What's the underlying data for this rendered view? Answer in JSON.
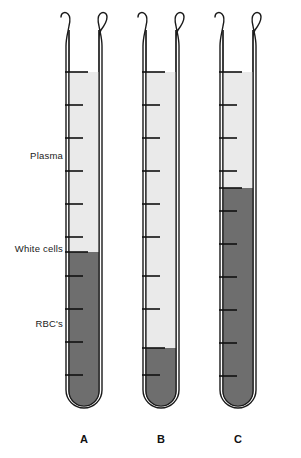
{
  "figure": {
    "background_color": "#ffffff",
    "width": 301,
    "height": 458
  },
  "colors": {
    "plasma_fill": "#eaeaea",
    "rbc_fill": "#6e6e6e",
    "glass_outline": "#1a1a1a",
    "graduation_mark": "#111111",
    "text": "#1a1a1a"
  },
  "side_labels": [
    {
      "id": "plasma",
      "text": "Plasma",
      "y": 150
    },
    {
      "id": "white-cells",
      "text": "White cells",
      "y": 243
    },
    {
      "id": "rbcs",
      "text": "RBC's",
      "y": 318
    }
  ],
  "tubes": [
    {
      "id": "A",
      "caption": "A",
      "center_x": 84,
      "plasma_top_y": 72,
      "rbc_top_y": 252,
      "fill_bottom_y": 405,
      "graduation_count": 10
    },
    {
      "id": "B",
      "caption": "B",
      "center_x": 161,
      "plasma_top_y": 72,
      "rbc_top_y": 348,
      "fill_bottom_y": 405,
      "graduation_count": 10
    },
    {
      "id": "C",
      "caption": "C",
      "center_x": 238,
      "plasma_top_y": 72,
      "rbc_top_y": 188,
      "fill_bottom_y": 405,
      "graduation_count": 10
    }
  ],
  "chart_data": {
    "type": "bar",
    "xlabel": "",
    "ylabel": "Tube level",
    "categories": [
      "A",
      "B",
      "C"
    ],
    "grid": false,
    "legend_position": "left",
    "series": [
      {
        "name": "Plasma",
        "values": [
          54,
          83,
          19
        ]
      },
      {
        "name": "White cells",
        "values": [
          1,
          1,
          1
        ]
      },
      {
        "name": "RBC's",
        "values": [
          45,
          16,
          80
        ]
      }
    ],
    "annotations": [
      "Tube A shows a normal hematocrit with plasma above the buffy coat and packed red cells below.",
      "Tube B shows a low hematocrit (anemia) with a small packed red cell column.",
      "Tube C shows a high hematocrit (polycythemia) with a large packed red cell column."
    ]
  }
}
